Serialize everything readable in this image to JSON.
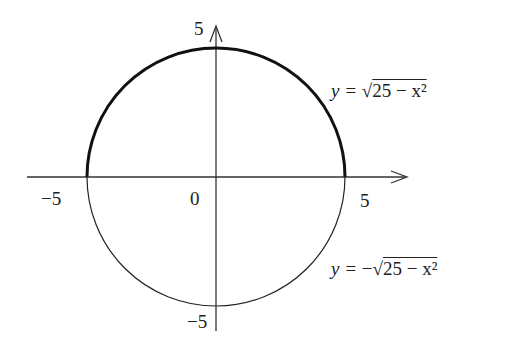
{
  "figure": {
    "radius": 5,
    "origin_label": "0",
    "x_ticks": [
      {
        "value": -5,
        "label": "−5"
      },
      {
        "value": 5,
        "label": "5"
      }
    ],
    "y_ticks": [
      {
        "value": 5,
        "label": "5"
      },
      {
        "value": -5,
        "label": "−5"
      }
    ],
    "upper_curve": {
      "equation_lhs": "y = ",
      "equation_sign": "",
      "equation_radicand": "25 − x²",
      "stroke": "#111111",
      "weight": "thick"
    },
    "lower_curve": {
      "equation_lhs": "y = ",
      "equation_sign": "−",
      "equation_radicand": "25 − x²",
      "stroke": "#111111",
      "weight": "thin"
    }
  }
}
